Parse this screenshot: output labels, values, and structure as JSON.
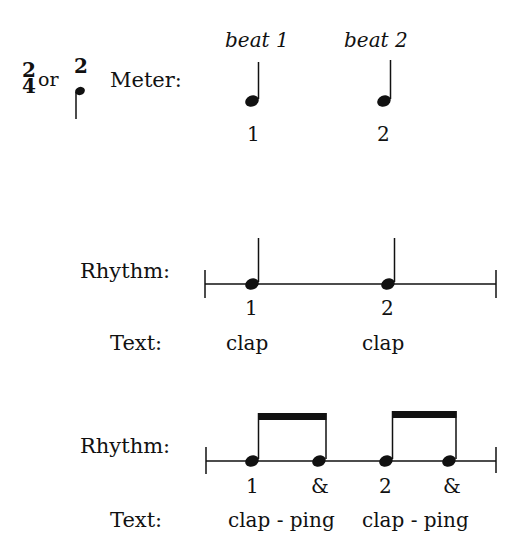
{
  "meter": {
    "sig_a_top": "2",
    "sig_a_bottom": "4",
    "or_text": "or",
    "sig_b_top": "2",
    "sig_b_bottom_icon": "quarter-note-icon",
    "label": "Meter:",
    "beats": [
      {
        "heading": "beat 1",
        "number": "1"
      },
      {
        "heading": "beat 2",
        "number": "2"
      }
    ]
  },
  "rhythm1": {
    "rhythm_label": "Rhythm:",
    "text_label": "Text:",
    "counts": [
      "1",
      "2"
    ],
    "syllables": [
      "clap",
      "clap"
    ]
  },
  "rhythm2": {
    "rhythm_label": "Rhythm:",
    "text_label": "Text:",
    "counts": [
      "1",
      "&",
      "2",
      "&"
    ],
    "syllables": [
      "clap - ping",
      "clap - ping"
    ]
  },
  "colors": {
    "ink": "#111111",
    "background": "#ffffff"
  }
}
